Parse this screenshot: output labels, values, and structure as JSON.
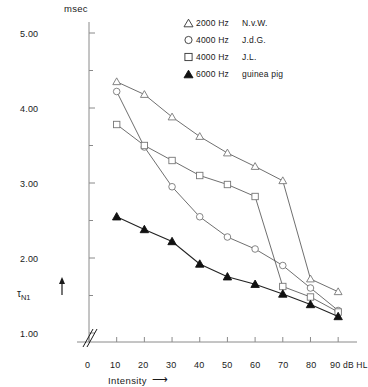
{
  "chart_data": {
    "type": "line",
    "title": "",
    "unit_label": "msec",
    "xlabel": "Intensity",
    "xunit": "dB HL",
    "ylabel": "τN1",
    "xlim": [
      0,
      95
    ],
    "ylim": [
      1.0,
      5.25
    ],
    "xticks": [
      0,
      10,
      20,
      30,
      40,
      50,
      60,
      70,
      80,
      90
    ],
    "xtick_labels": [
      "0",
      "10",
      "20",
      "30",
      "40",
      "50",
      "60",
      "70",
      "80",
      "90"
    ],
    "yticks": [
      1.0,
      1.5,
      2.0,
      2.5,
      3.0,
      3.5,
      4.0,
      4.5,
      5.0
    ],
    "ytick_labels": [
      "1.00",
      "",
      "2.00",
      "",
      "3.00",
      "",
      "4.00",
      "",
      "5.00"
    ],
    "grid": false,
    "axis_break": true,
    "legend_position": "top-right",
    "series": [
      {
        "name": "N.v.W.",
        "freq": "2000 Hz",
        "marker": "triangle-open",
        "x": [
          10,
          20,
          30,
          40,
          50,
          60,
          70,
          80,
          90
        ],
        "y": [
          4.35,
          4.18,
          3.88,
          3.62,
          3.4,
          3.22,
          3.03,
          1.72,
          1.55
        ]
      },
      {
        "name": "J.d.G.",
        "freq": "4000 Hz",
        "marker": "circle-open",
        "x": [
          10,
          20,
          30,
          40,
          50,
          60,
          70,
          80,
          90
        ],
        "y": [
          4.22,
          3.48,
          2.95,
          2.55,
          2.28,
          2.12,
          1.9,
          1.6,
          1.3
        ]
      },
      {
        "name": "J.L.",
        "freq": "4000 Hz",
        "marker": "square-open",
        "x": [
          10,
          20,
          30,
          40,
          50,
          60,
          70,
          80,
          90
        ],
        "y": [
          3.78,
          3.5,
          3.3,
          3.1,
          2.98,
          2.82,
          1.62,
          1.48,
          1.28
        ]
      },
      {
        "name": "guinea pig",
        "freq": "6000 Hz",
        "marker": "triangle-filled",
        "x": [
          10,
          20,
          30,
          40,
          50,
          60,
          70,
          80,
          90
        ],
        "y": [
          2.55,
          2.38,
          2.22,
          1.92,
          1.75,
          1.65,
          1.52,
          1.38,
          1.22
        ]
      }
    ]
  },
  "legend": {
    "items": [
      {
        "marker": "triangle-open",
        "freq": "2000 Hz",
        "name": "N.v.W."
      },
      {
        "marker": "circle-open",
        "freq": "4000 Hz",
        "name": "J.d.G."
      },
      {
        "marker": "square-open",
        "freq": "4000 Hz",
        "name": "J.L."
      },
      {
        "marker": "triangle-filled",
        "freq": "6000 Hz",
        "name": "guinea pig"
      }
    ]
  },
  "axes": {
    "unit_top": "msec",
    "y_label": "τ",
    "y_label_sub": "N1",
    "x_title": "Intensity",
    "x_arrow": "⟶",
    "x_unit": "dB HL"
  },
  "colors": {
    "ink": "#1a1a1a",
    "axis": "#8a8a8a",
    "line": "#555555",
    "marker_stroke": "#777777",
    "marker_fill": "#ffffff",
    "filled_marker": "#111111",
    "background": "#ffffff"
  }
}
